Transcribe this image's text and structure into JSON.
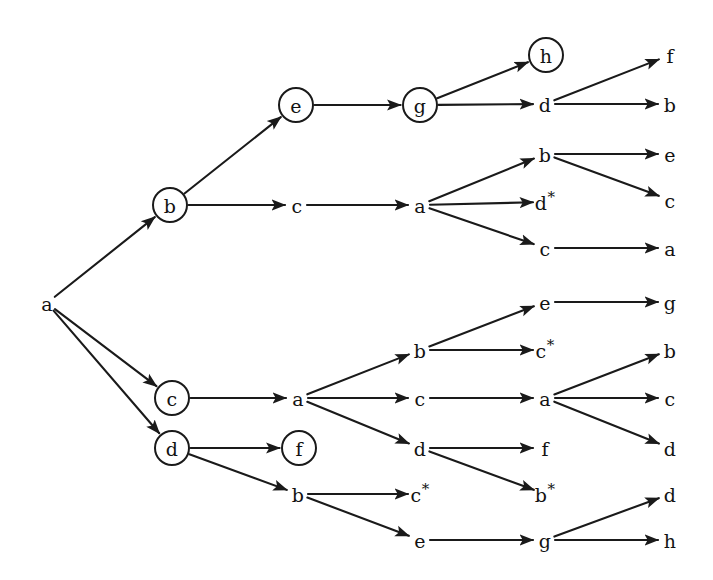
{
  "diagram": {
    "background_color": "#ffffff",
    "stroke_color": "#1a1a1a",
    "text_color": "#121212",
    "width": 713,
    "height": 580,
    "node_radius": 17,
    "nodes": [
      {
        "id": "n0",
        "label": "a",
        "starred": false,
        "circled": false,
        "x": 47,
        "y": 303,
        "depth": 0
      },
      {
        "id": "n1",
        "label": "b",
        "starred": false,
        "circled": true,
        "x": 170,
        "y": 205,
        "depth": 1
      },
      {
        "id": "n2",
        "label": "c",
        "starred": false,
        "circled": true,
        "x": 172,
        "y": 398,
        "depth": 1
      },
      {
        "id": "n3",
        "label": "d",
        "starred": false,
        "circled": true,
        "x": 172,
        "y": 448,
        "depth": 1
      },
      {
        "id": "n4",
        "label": "e",
        "starred": false,
        "circled": true,
        "x": 296,
        "y": 105,
        "depth": 2
      },
      {
        "id": "n5",
        "label": "c",
        "starred": false,
        "circled": false,
        "x": 297,
        "y": 205,
        "depth": 2
      },
      {
        "id": "n6",
        "label": "a",
        "starred": false,
        "circled": false,
        "x": 298,
        "y": 398,
        "depth": 2
      },
      {
        "id": "n7",
        "label": "f",
        "starred": false,
        "circled": true,
        "x": 299,
        "y": 448,
        "depth": 2
      },
      {
        "id": "n8",
        "label": "b",
        "starred": false,
        "circled": false,
        "x": 298,
        "y": 494,
        "depth": 2
      },
      {
        "id": "n9",
        "label": "g",
        "starred": false,
        "circled": true,
        "x": 420,
        "y": 105,
        "depth": 3
      },
      {
        "id": "n10",
        "label": "a",
        "starred": false,
        "circled": false,
        "x": 420,
        "y": 205,
        "depth": 3
      },
      {
        "id": "n11",
        "label": "b",
        "starred": false,
        "circled": false,
        "x": 420,
        "y": 350,
        "depth": 3
      },
      {
        "id": "n12",
        "label": "c",
        "starred": false,
        "circled": false,
        "x": 420,
        "y": 398,
        "depth": 3
      },
      {
        "id": "n13",
        "label": "d",
        "starred": false,
        "circled": false,
        "x": 420,
        "y": 448,
        "depth": 3
      },
      {
        "id": "n14",
        "label": "c",
        "starred": true,
        "circled": false,
        "x": 420,
        "y": 494,
        "depth": 3
      },
      {
        "id": "n15",
        "label": "e",
        "starred": false,
        "circled": false,
        "x": 420,
        "y": 540,
        "depth": 3
      },
      {
        "id": "n16",
        "label": "h",
        "starred": false,
        "circled": true,
        "x": 546,
        "y": 55,
        "depth": 4
      },
      {
        "id": "n17",
        "label": "d",
        "starred": false,
        "circled": false,
        "x": 545,
        "y": 104,
        "depth": 4
      },
      {
        "id": "n18",
        "label": "b",
        "starred": false,
        "circled": false,
        "x": 545,
        "y": 154,
        "depth": 4
      },
      {
        "id": "n19",
        "label": "d",
        "starred": true,
        "circled": false,
        "x": 545,
        "y": 202,
        "depth": 4
      },
      {
        "id": "n20",
        "label": "c",
        "starred": false,
        "circled": false,
        "x": 545,
        "y": 248,
        "depth": 4
      },
      {
        "id": "n21",
        "label": "e",
        "starred": false,
        "circled": false,
        "x": 545,
        "y": 302,
        "depth": 4
      },
      {
        "id": "n22",
        "label": "c",
        "starred": true,
        "circled": false,
        "x": 545,
        "y": 350,
        "depth": 4
      },
      {
        "id": "n23",
        "label": "a",
        "starred": false,
        "circled": false,
        "x": 545,
        "y": 398,
        "depth": 4
      },
      {
        "id": "n24",
        "label": "f",
        "starred": false,
        "circled": false,
        "x": 545,
        "y": 448,
        "depth": 4
      },
      {
        "id": "n25",
        "label": "b",
        "starred": true,
        "circled": false,
        "x": 545,
        "y": 494,
        "depth": 4
      },
      {
        "id": "n26",
        "label": "g",
        "starred": false,
        "circled": false,
        "x": 545,
        "y": 540,
        "depth": 4
      },
      {
        "id": "n27",
        "label": "f",
        "starred": false,
        "circled": false,
        "x": 670,
        "y": 55,
        "depth": 5
      },
      {
        "id": "n28",
        "label": "b",
        "starred": false,
        "circled": false,
        "x": 670,
        "y": 104,
        "depth": 5
      },
      {
        "id": "n29",
        "label": "e",
        "starred": false,
        "circled": false,
        "x": 670,
        "y": 154,
        "depth": 5
      },
      {
        "id": "n30",
        "label": "c",
        "starred": false,
        "circled": false,
        "x": 670,
        "y": 200,
        "depth": 5
      },
      {
        "id": "n31",
        "label": "a",
        "starred": false,
        "circled": false,
        "x": 670,
        "y": 248,
        "depth": 5
      },
      {
        "id": "n32",
        "label": "g",
        "starred": false,
        "circled": false,
        "x": 670,
        "y": 302,
        "depth": 5
      },
      {
        "id": "n33",
        "label": "b",
        "starred": false,
        "circled": false,
        "x": 670,
        "y": 350,
        "depth": 5
      },
      {
        "id": "n34",
        "label": "c",
        "starred": false,
        "circled": false,
        "x": 670,
        "y": 398,
        "depth": 5
      },
      {
        "id": "n35",
        "label": "d",
        "starred": false,
        "circled": false,
        "x": 670,
        "y": 448,
        "depth": 5
      },
      {
        "id": "n36",
        "label": "d",
        "starred": false,
        "circled": false,
        "x": 670,
        "y": 494,
        "depth": 5
      },
      {
        "id": "n37",
        "label": "h",
        "starred": false,
        "circled": false,
        "x": 670,
        "y": 540,
        "depth": 5
      }
    ],
    "edges": [
      {
        "from": "n0",
        "to": "n1"
      },
      {
        "from": "n0",
        "to": "n2"
      },
      {
        "from": "n0",
        "to": "n3"
      },
      {
        "from": "n1",
        "to": "n4"
      },
      {
        "from": "n1",
        "to": "n5"
      },
      {
        "from": "n4",
        "to": "n9"
      },
      {
        "from": "n5",
        "to": "n10"
      },
      {
        "from": "n9",
        "to": "n16"
      },
      {
        "from": "n9",
        "to": "n17"
      },
      {
        "from": "n17",
        "to": "n27"
      },
      {
        "from": "n17",
        "to": "n28"
      },
      {
        "from": "n10",
        "to": "n18"
      },
      {
        "from": "n10",
        "to": "n19"
      },
      {
        "from": "n10",
        "to": "n20"
      },
      {
        "from": "n18",
        "to": "n29"
      },
      {
        "from": "n18",
        "to": "n30"
      },
      {
        "from": "n20",
        "to": "n31"
      },
      {
        "from": "n2",
        "to": "n6"
      },
      {
        "from": "n6",
        "to": "n11"
      },
      {
        "from": "n6",
        "to": "n12"
      },
      {
        "from": "n6",
        "to": "n13"
      },
      {
        "from": "n11",
        "to": "n21"
      },
      {
        "from": "n11",
        "to": "n22"
      },
      {
        "from": "n21",
        "to": "n32"
      },
      {
        "from": "n12",
        "to": "n23"
      },
      {
        "from": "n23",
        "to": "n33"
      },
      {
        "from": "n23",
        "to": "n34"
      },
      {
        "from": "n23",
        "to": "n35"
      },
      {
        "from": "n13",
        "to": "n24"
      },
      {
        "from": "n13",
        "to": "n25"
      },
      {
        "from": "n3",
        "to": "n7"
      },
      {
        "from": "n3",
        "to": "n8"
      },
      {
        "from": "n8",
        "to": "n14"
      },
      {
        "from": "n8",
        "to": "n15"
      },
      {
        "from": "n15",
        "to": "n26"
      },
      {
        "from": "n26",
        "to": "n36"
      },
      {
        "from": "n26",
        "to": "n37"
      }
    ]
  }
}
